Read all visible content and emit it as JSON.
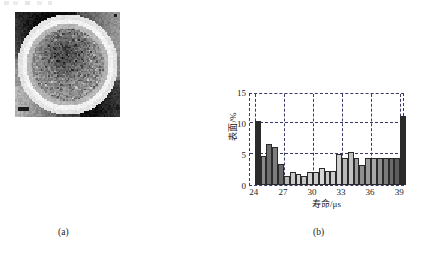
{
  "figure": {
    "panels": [
      {
        "id": "a",
        "caption": "(a)",
        "type": "micrograph",
        "description": "pixelated grayscale lifetime map of a circular wafer region"
      },
      {
        "id": "b",
        "caption": "(b)",
        "type": "histogram"
      }
    ]
  },
  "chart_data": {
    "type": "bar",
    "title": "",
    "xlabel": "寿命/μs",
    "ylabel": "表面/%",
    "xlim": [
      23.5,
      39.5
    ],
    "ylim": [
      0,
      15
    ],
    "yticks": [
      0,
      5,
      10,
      15
    ],
    "xticks": [
      24,
      27,
      30,
      33,
      36,
      39
    ],
    "grid": true,
    "legend": false,
    "bin_width": 0.6,
    "categories": [
      "24.0",
      "24.6",
      "25.2",
      "25.8",
      "26.4",
      "27.0",
      "27.6",
      "28.2",
      "28.8",
      "29.4",
      "30.0",
      "30.6",
      "31.2",
      "31.8",
      "32.4",
      "33.0",
      "33.6",
      "34.2",
      "34.8",
      "35.4",
      "36.0",
      "36.6",
      "37.2",
      "37.8",
      "38.4",
      "39.0"
    ],
    "values": [
      10.4,
      4.6,
      6.6,
      6.1,
      3.4,
      1.5,
      2.1,
      1.7,
      1.5,
      2.1,
      2.1,
      2.7,
      2.2,
      2.2,
      5.0,
      4.3,
      5.3,
      4.4,
      3.3,
      4.4,
      4.3,
      4.3,
      4.4,
      4.4,
      4.4,
      11.2
    ],
    "bar_colors": [
      "#2b2b2b",
      "#8a8a8a",
      "#6e6e6e",
      "#7d7d7d",
      "#6b6b6b",
      "#b8b8b8",
      "#c9c9c9",
      "#d2d2d2",
      "#c4c4c4",
      "#cfcfcf",
      "#c9c9c9",
      "#d6d6d6",
      "#c6c6c6",
      "#cccccc",
      "#cfcfcf",
      "#b9b9b9",
      "#c2c2c2",
      "#9e9e9e",
      "#8e8e8e",
      "#9a9a9a",
      "#a8a8a8",
      "#8f8f8f",
      "#7a7a7a",
      "#6a6a6a",
      "#5c5c5c",
      "#2b2b2b"
    ],
    "axis_color": "#3a3a6a",
    "tick_label_color": "#1a1a1a"
  }
}
